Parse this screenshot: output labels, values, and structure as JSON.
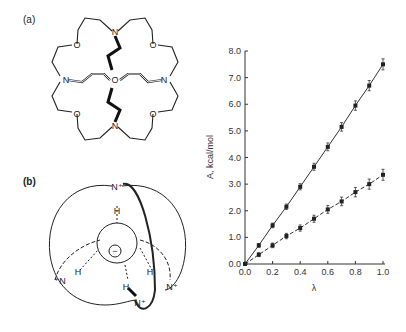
{
  "panels": {
    "a": {
      "label": "(a)",
      "atoms": {
        "N": "N",
        "O": "O"
      }
    },
    "b": {
      "label": "(b)",
      "atoms": {
        "Nplus_top": "N⁺",
        "H": "H",
        "Nplus_left": "⁺N",
        "Nplus_right": "N⁺",
        "Nplus_bottom": "N⁺",
        "anion": "−"
      }
    }
  },
  "chart_data": {
    "type": "line",
    "title": "",
    "xlabel": "λ",
    "ylabel": "A, kcal/mol",
    "xlim": [
      0.0,
      1.0
    ],
    "ylim": [
      0.0,
      8.0
    ],
    "x_ticks": [
      "0.0",
      "0.2",
      "0.4",
      "0.6",
      "0.8",
      "1.0"
    ],
    "y_ticks": [
      "0.0",
      "1.0",
      "2.0",
      "3.0",
      "4.0",
      "5.0",
      "6.0",
      "7.0",
      "8.0"
    ],
    "grid": false,
    "x": [
      0.0,
      0.1,
      0.2,
      0.3,
      0.4,
      0.5,
      0.6,
      0.7,
      0.8,
      0.9,
      1.0
    ],
    "series": [
      {
        "name": "upper (solid line)",
        "style": "solid",
        "values": [
          0.0,
          0.7,
          1.45,
          2.15,
          2.9,
          3.65,
          4.4,
          5.15,
          5.95,
          6.7,
          7.5
        ]
      },
      {
        "name": "lower (dashed line)",
        "style": "dashed",
        "values": [
          0.0,
          0.35,
          0.7,
          1.05,
          1.35,
          1.7,
          2.05,
          2.35,
          2.7,
          3.0,
          3.35
        ]
      }
    ]
  }
}
